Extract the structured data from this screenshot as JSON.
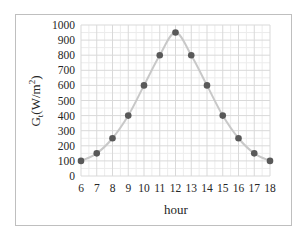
{
  "chart_data": {
    "type": "line",
    "title": "",
    "xlabel": "hour",
    "ylabel": "Gt(W/m2)",
    "ylabel_parts": {
      "main": "G",
      "sub": "t",
      "unit_pre": "(W/m",
      "sup": "2",
      "unit_post": ")"
    },
    "x": [
      6,
      7,
      8,
      9,
      10,
      11,
      12,
      13,
      14,
      15,
      16,
      17,
      18
    ],
    "series": [
      {
        "name": "Gt",
        "values": [
          100,
          150,
          250,
          400,
          600,
          800,
          950,
          800,
          600,
          400,
          250,
          150,
          100
        ],
        "line_color": "#c8c8c8",
        "marker_color": "#595959"
      }
    ],
    "xlim": [
      6,
      18
    ],
    "ylim": [
      0,
      1000
    ],
    "xticks": [
      "6",
      "7",
      "8",
      "9",
      "10",
      "11",
      "12",
      "13",
      "14",
      "15",
      "16",
      "17",
      "18"
    ],
    "yticks": [
      "0",
      "100",
      "200",
      "300",
      "400",
      "500",
      "600",
      "700",
      "800",
      "900",
      "1000"
    ],
    "grid": true,
    "minor_grid": true,
    "legend": "none",
    "smooth": true
  },
  "colors": {
    "frame_border": "#bfbfbf",
    "grid_major": "#d9d9d9",
    "grid_minor": "#ececec",
    "text": "#262626"
  }
}
